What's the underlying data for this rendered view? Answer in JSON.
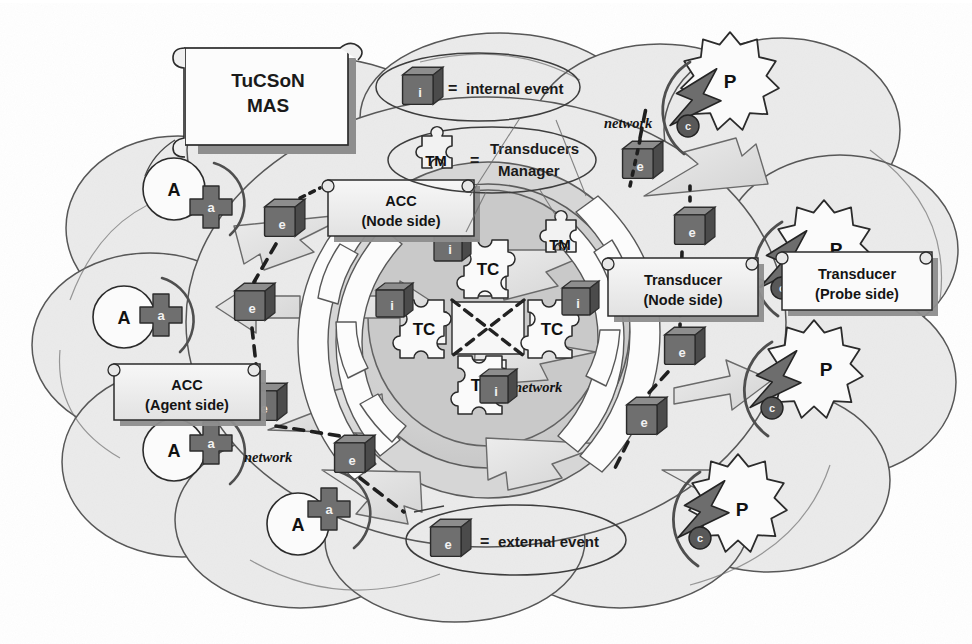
{
  "figure": {
    "title": "TuCSoN MAS",
    "domain": "agent-infrastructure-architecture",
    "palette": {
      "page_background": "#ffffff",
      "cloud_fill": "#ebebeb",
      "cloud_stroke": "#5a5a5a",
      "node_outer_fill": "#d2d2d2",
      "node_mid_fill": "#c0c0c0",
      "node_inner_fill": "#bdbdbd",
      "cube_face": "#6d6d6d",
      "cube_top": "#8a8a8a",
      "cube_side": "#4a4a4a",
      "box_fill": "#f3f3f3",
      "box_shadow": "#8e8e8e",
      "arrow_fill": "#e0e0e0",
      "arrow_stroke": "#6a6a6a",
      "ribbon_fill": "#fdfdfd",
      "bolt_fill": "#6e6e6e",
      "accent_dark": "#3d3d3d"
    }
  },
  "scroll": {
    "line1": "TuCSoN",
    "line2": "MAS"
  },
  "legend": {
    "internal": {
      "glyph": "i",
      "equals": "=",
      "label": "internal event"
    },
    "external": {
      "glyph": "e",
      "equals": "=",
      "label": "external event"
    },
    "transducers_manager": {
      "glyph": "TM",
      "equals": "=",
      "line1": "Transducers",
      "line2": "Manager"
    }
  },
  "boxes": {
    "acc_node": {
      "line1": "ACC",
      "line2": "(Node side)"
    },
    "acc_agent": {
      "line1": "ACC",
      "line2": "(Agent side)"
    },
    "transducer_node": {
      "line1": "Transducer",
      "line2": "(Node side)"
    },
    "transducer_probe": {
      "line1": "Transducer",
      "line2": "(Probe side)"
    }
  },
  "node": {
    "tuple_centres": [
      {
        "label": "TC",
        "position": "north"
      },
      {
        "label": "TC",
        "position": "west"
      },
      {
        "label": "TC",
        "position": "east"
      },
      {
        "label": "TC",
        "position": "south"
      }
    ],
    "transducers_manager_label": "TM",
    "internal_events": [
      {
        "glyph": "i",
        "position": "top-left-of-north-tc"
      },
      {
        "glyph": "i",
        "position": "left-of-west-tc"
      },
      {
        "glyph": "i",
        "position": "right-of-east-tc"
      },
      {
        "glyph": "i",
        "position": "below-south-tc"
      }
    ],
    "network_label": "network"
  },
  "agents": [
    {
      "label": "A",
      "acc_glyph": "a"
    },
    {
      "label": "A",
      "acc_glyph": "a"
    },
    {
      "label": "A",
      "acc_glyph": "a"
    },
    {
      "label": "A",
      "acc_glyph": "a"
    }
  ],
  "probes": [
    {
      "label": "P",
      "coupler_glyph": "c"
    },
    {
      "label": "P",
      "coupler_glyph": "c"
    },
    {
      "label": "P",
      "coupler_glyph": "c"
    },
    {
      "label": "P",
      "coupler_glyph": "c"
    }
  ],
  "external_events": [
    {
      "glyph": "e",
      "side": "agent-upper"
    },
    {
      "glyph": "e",
      "side": "agent-middle"
    },
    {
      "glyph": "e",
      "side": "agent-lower"
    },
    {
      "glyph": "e",
      "side": "agent-bottom"
    },
    {
      "glyph": "e",
      "side": "probe-top"
    },
    {
      "glyph": "e",
      "side": "probe-upper"
    },
    {
      "glyph": "e",
      "side": "probe-middle"
    },
    {
      "glyph": "e",
      "side": "probe-lower"
    }
  ],
  "network_labels": [
    {
      "text": "network",
      "where": "agent-side-bottom"
    },
    {
      "text": "network",
      "where": "probe-side-top"
    },
    {
      "text": "network",
      "where": "node-core"
    }
  ]
}
